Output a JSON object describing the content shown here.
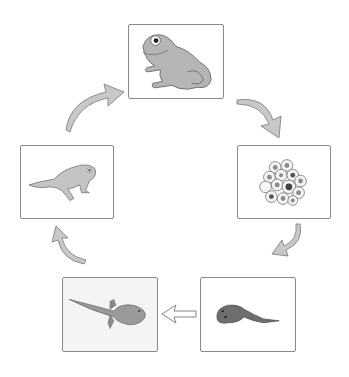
{
  "diagram": {
    "title": "Frog life cycle",
    "stages": [
      {
        "id": "adult-frog",
        "label": "Adult frog"
      },
      {
        "id": "eggs",
        "label": "Frog spawn (eggs)"
      },
      {
        "id": "tadpole",
        "label": "Tadpole"
      },
      {
        "id": "tadpole-with-legs",
        "label": "Tadpole with legs"
      },
      {
        "id": "froglet",
        "label": "Froglet"
      }
    ],
    "arrows": [
      {
        "from": "adult-frog",
        "to": "eggs",
        "direction": "clockwise-curved"
      },
      {
        "from": "eggs",
        "to": "tadpole",
        "direction": "clockwise-curved"
      },
      {
        "from": "tadpole",
        "to": "tadpole-with-legs",
        "direction": "left-outline"
      },
      {
        "from": "tadpole-with-legs",
        "to": "froglet",
        "direction": "clockwise-curved"
      },
      {
        "from": "froglet",
        "to": "adult-frog",
        "direction": "clockwise-curved"
      }
    ],
    "colors": {
      "frame": "#8a8a8a",
      "animal_fill": "#b5b5b5",
      "animal_dark": "#6e6e6e",
      "arrow_fill": "#c8c8c8"
    }
  }
}
